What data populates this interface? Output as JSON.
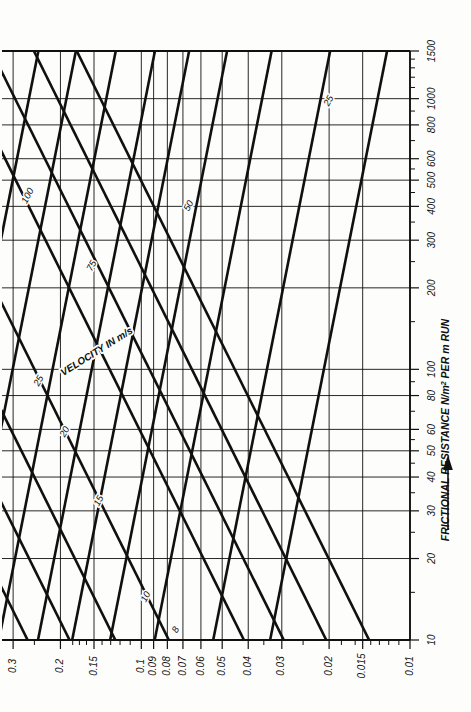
{
  "figure": {
    "name": "duct-sizing-chart",
    "orientation": "rotated-90-clockwise",
    "background_color": "#fdfdfb",
    "ink_color": "#101010"
  },
  "axes": {
    "resistance": {
      "label": "FRICTIONAL RESISTANCE N/m",
      "label_superscript": "2",
      "label_suffix": " PER m RUN",
      "arrow_icon": "arrow-up-icon",
      "scale": "log",
      "min": 10,
      "max": 1500,
      "major_ticks": [
        10,
        20,
        30,
        40,
        50,
        60,
        80,
        100,
        200,
        300,
        400,
        500,
        600,
        800,
        1000,
        1500
      ],
      "major_tick_labels": [
        "10",
        "20",
        "30",
        "40",
        "50",
        "60",
        "80",
        "100",
        "200",
        "300",
        "400",
        "500",
        "600",
        "800",
        "1000",
        "1500"
      ],
      "minor_ticks": [
        15,
        25,
        35,
        45,
        55,
        70,
        90,
        150,
        250,
        350,
        450,
        550,
        700,
        900,
        1100,
        1200,
        1300,
        1400
      ]
    },
    "diameter": {
      "label": "",
      "scale": "log",
      "min": 0.01,
      "max": 0.33,
      "major_ticks": [
        0.3,
        0.2,
        0.15,
        0.1,
        0.09,
        0.08,
        0.07,
        0.06,
        0.05,
        0.04,
        0.03,
        0.02,
        0.015,
        0.01
      ],
      "major_tick_labels": [
        "0.3",
        "0.2",
        "0.15",
        "0.1",
        "0.09",
        "0.08",
        "0.07",
        "0.06",
        "0.05",
        "0.04",
        "0.03",
        "0.02",
        "0.015",
        "0.01"
      ],
      "minor_ticks": [
        0.25,
        0.18,
        0.17,
        0.16,
        0.14,
        0.13,
        0.12,
        0.11,
        0.035,
        0.025,
        0.018,
        0.016,
        0.014,
        0.013,
        0.012,
        0.011
      ]
    }
  },
  "families": {
    "velocity": {
      "legend_label": "VELOCITY IN m/s",
      "line_labels": [
        "8",
        "10",
        "15",
        "20",
        "25"
      ],
      "values": [
        8,
        10,
        15,
        20,
        25
      ],
      "direction": "rising-to-the-right"
    },
    "flow": {
      "legend_label": "",
      "line_labels": [
        "25",
        "50",
        "75",
        "100"
      ],
      "values": [
        25,
        50,
        75,
        100
      ],
      "direction": "falling-to-the-right"
    }
  },
  "chart_data": {
    "type": "line",
    "title": "",
    "subtitle": "",
    "xlabel": "FRICTIONAL RESISTANCE N/m2 PER m RUN",
    "ylabel": "DIAMETER (m)",
    "xscale": "log",
    "yscale": "log",
    "xlim": [
      10,
      1500
    ],
    "ylim": [
      0.01,
      0.33
    ],
    "grid": true,
    "legend_position": "inline-curve-labels",
    "xticks": [
      10,
      20,
      30,
      40,
      50,
      60,
      80,
      100,
      200,
      300,
      400,
      500,
      600,
      800,
      1000,
      1500
    ],
    "xticklabels": [
      "10",
      "20",
      "30",
      "40",
      "50",
      "60",
      "80",
      "100",
      "200",
      "300",
      "400",
      "500",
      "600",
      "800",
      "1000",
      "1500"
    ],
    "yticks": [
      0.01,
      0.015,
      0.02,
      0.03,
      0.04,
      0.05,
      0.06,
      0.07,
      0.08,
      0.09,
      0.1,
      0.15,
      0.2,
      0.3
    ],
    "yticklabels": [
      "0.01",
      "0.015",
      "0.02",
      "0.03",
      "0.04",
      "0.05",
      "0.06",
      "0.07",
      "0.08",
      "0.09",
      "0.1",
      "0.15",
      "0.2",
      "0.3"
    ],
    "annotations": [
      {
        "text": "VELOCITY IN m/s",
        "kind": "family-legend"
      },
      {
        "text": "100",
        "kind": "flow-line-label"
      },
      {
        "text": "75",
        "kind": "flow-line-label"
      },
      {
        "text": "50",
        "kind": "flow-line-label"
      },
      {
        "text": "25",
        "kind": "flow-line-label"
      },
      {
        "text": "25",
        "kind": "velocity-line-label"
      },
      {
        "text": "20",
        "kind": "velocity-line-label"
      },
      {
        "text": "15",
        "kind": "velocity-line-label"
      },
      {
        "text": "10",
        "kind": "velocity-line-label"
      },
      {
        "text": "8",
        "kind": "velocity-line-label"
      }
    ],
    "series": [
      {
        "name": "v = 8 m/s",
        "family": "velocity",
        "slope_log": 0.5,
        "ref_x": 10,
        "ref_y": 0.0295
      },
      {
        "name": "v = 10 m/s",
        "family": "velocity",
        "slope_log": 0.5,
        "ref_x": 10,
        "ref_y": 0.0415
      },
      {
        "name": "v = 15 m/s",
        "family": "velocity",
        "slope_log": 0.5,
        "ref_x": 10,
        "ref_y": 0.079
      },
      {
        "name": "v = 20 m/s",
        "family": "velocity",
        "slope_log": 0.5,
        "ref_x": 10,
        "ref_y": 0.125
      },
      {
        "name": "v = 25 m/s",
        "family": "velocity",
        "slope_log": 0.5,
        "ref_x": 10,
        "ref_y": 0.185
      },
      {
        "name": "Q = 25",
        "family": "flow",
        "slope_log": -0.2,
        "ref_x": 1000,
        "ref_y": 0.0215
      },
      {
        "name": "Q = 50",
        "family": "flow",
        "slope_log": -0.2,
        "ref_x": 1000,
        "ref_y": 0.0355
      },
      {
        "name": "Q = 75",
        "family": "flow",
        "slope_log": -0.2,
        "ref_x": 1000,
        "ref_y": 0.052
      },
      {
        "name": "Q = 100",
        "family": "flow",
        "slope_log": -0.2,
        "ref_x": 1000,
        "ref_y": 0.072
      }
    ]
  }
}
